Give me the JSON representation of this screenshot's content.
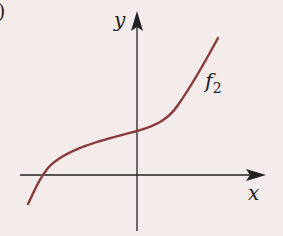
{
  "figure": {
    "part_marker": ")",
    "axis_x_label": "x",
    "axis_y_label": "y",
    "curve_label_main": "f",
    "curve_label_sub": "2",
    "colors": {
      "background": "#f4ebeb",
      "axes": "#222222",
      "curve": "#8b3a3a"
    }
  }
}
